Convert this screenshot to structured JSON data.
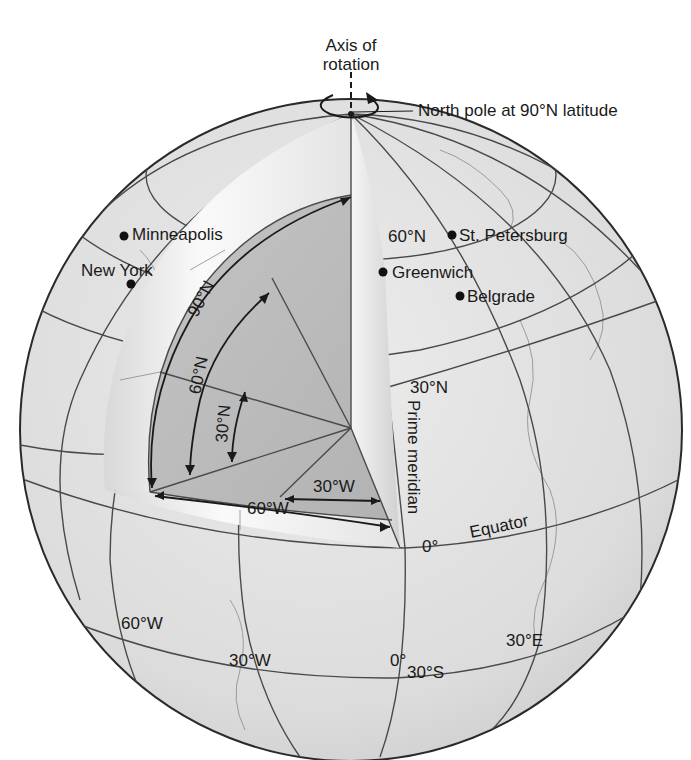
{
  "axis": {
    "label_line1": "Axis of",
    "label_line2": "rotation"
  },
  "north_pole": {
    "label": "North pole at 90°N latitude"
  },
  "cities": [
    {
      "name": "Minneapolis"
    },
    {
      "name": "New York"
    },
    {
      "name": "St. Petersburg"
    },
    {
      "name": "Greenwich"
    },
    {
      "name": "Belgrade"
    }
  ],
  "latitude_labels": {
    "lat60": "60°N",
    "lat30": "30°N",
    "equator_value": "0°",
    "equator_name": "Equator",
    "lat30s": "30°S"
  },
  "longitude_labels": {
    "prime_meridian": "Prime meridian",
    "w60": "60°W",
    "w30": "30°W",
    "zero": "0°",
    "e30": "30°E"
  },
  "cutaway_angles": {
    "lat90": "90°N",
    "lat60": "60°N",
    "lat30": "30°N",
    "lon30w": "30°W",
    "lon60w": "60°W"
  },
  "colors": {
    "globe_fill": "#e2e2e2",
    "globe_stroke": "#2a2a2a",
    "wedge_dark": "#b9b9b9",
    "wedge_mid": "#c8c8c8",
    "crust_light": "#f2f2f2"
  }
}
